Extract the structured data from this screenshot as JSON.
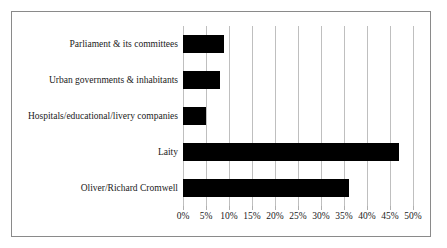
{
  "chart": {
    "title": "",
    "border_color": "#8a8a8a",
    "bar_color": "#000000",
    "gridline_color": "#bfbfbf"
  },
  "chart_data": {
    "type": "bar",
    "orientation": "horizontal",
    "title": "",
    "subtitle": "",
    "xlabel": "",
    "ylabel": "",
    "grid": true,
    "legend": false,
    "xlim": [
      0,
      50
    ],
    "xtick_step": 5,
    "categories": [
      "Parliament & its committees",
      "Urban governments & inhabitants",
      "Hospitals/educational/livery companies",
      "Laity",
      "Oliver/Richard Cromwell"
    ],
    "values": [
      9,
      8,
      5,
      47,
      36
    ],
    "value_unit": "%",
    "xticklabels": [
      "0%",
      "5%",
      "10%",
      "15%",
      "20%",
      "25%",
      "30%",
      "35%",
      "40%",
      "45%",
      "50%"
    ],
    "xtickvalues": [
      0,
      5,
      10,
      15,
      20,
      25,
      30,
      35,
      40,
      45,
      50
    ],
    "series": [
      {
        "name": "",
        "values": [
          9,
          8,
          5,
          47,
          36
        ]
      }
    ]
  }
}
